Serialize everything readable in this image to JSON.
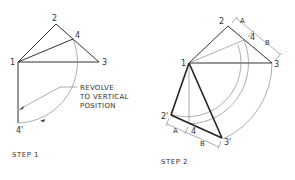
{
  "step1": {
    "caption": "STEP 1",
    "note_lines": [
      "REVOLVE",
      "TO VERTICAL",
      "POSITION"
    ],
    "points": {
      "p1": "1",
      "p2": "2",
      "p3": "3",
      "p4": "4",
      "p4prime": "4'"
    }
  },
  "step2": {
    "caption": "STEP 2",
    "points": {
      "p1": "1",
      "p2": "2",
      "p3": "3",
      "p4": "4",
      "p2prime": "2'",
      "p3prime": "3'",
      "p4prime": "4"
    },
    "dimensions": {
      "top_a": "A",
      "top_b": "B",
      "bottom_a": "A",
      "bottom_b": "B"
    }
  },
  "colors": {
    "line": "#333333",
    "background": "#ffffff"
  }
}
